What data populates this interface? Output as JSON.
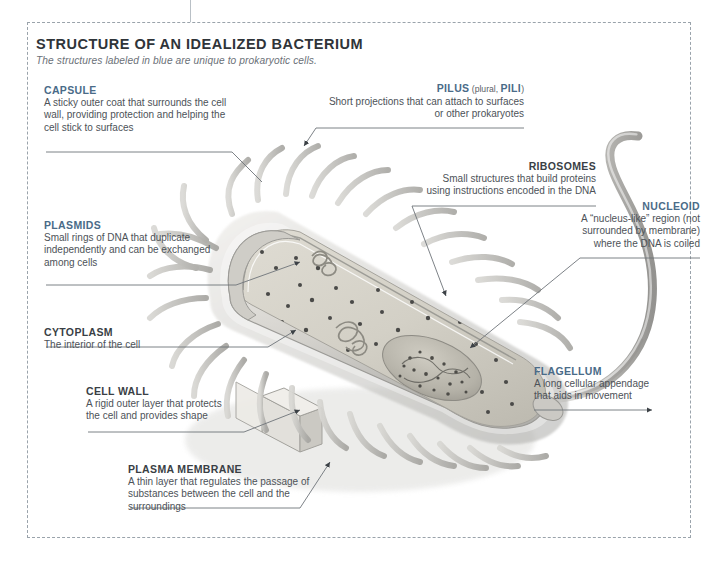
{
  "figure": {
    "title": "STRUCTURE OF AN IDEALIZED BACTERIUM",
    "subtitle": "The structures labeled in blue are unique to prokaryotic cells.",
    "accent_blue": "#4a6b88",
    "neutral_dark": "#3a3f45",
    "body_gray": "#4d5258",
    "border_style": "dashed"
  },
  "labels": {
    "capsule": {
      "heading": "CAPSULE",
      "unique": true,
      "body": "A sticky outer coat that surrounds the cell wall, providing protection and helping the cell stick to surfaces"
    },
    "plasmids": {
      "heading": "PLASMIDS",
      "unique": true,
      "body": "Small rings of DNA that duplicate independently and can be exchanged among cells"
    },
    "cytoplasm": {
      "heading": "CYTOPLASM",
      "unique": false,
      "body": "The interior of the cell"
    },
    "cell_wall": {
      "heading": "CELL WALL",
      "unique": false,
      "body": "A rigid outer layer that protects the cell and provides shape"
    },
    "plasma_membrane": {
      "heading": "PLASMA MEMBRANE",
      "unique": false,
      "body": "A thin layer that regulates the passage of substances between the cell and the surroundings"
    },
    "pilus": {
      "heading": "PILUS",
      "heading_suffix_pre": " (plural, ",
      "heading_suffix_bold": "PILI",
      "heading_suffix_post": ")",
      "unique": true,
      "body": "Short projections that can attach to surfaces or other prokaryotes"
    },
    "ribosomes": {
      "heading": "RIBOSOMES",
      "unique": false,
      "body": "Small structures that build proteins using instructions encoded in the DNA"
    },
    "nucleoid": {
      "heading": "NUCLEOID",
      "unique": true,
      "body": "A “nucleus-like” region (not surrounded by membrane) where the DNA is coiled"
    },
    "flagellum": {
      "heading": "FLAGELLUM",
      "unique": true,
      "body": "A long cellular appendage that aids in movement"
    }
  }
}
